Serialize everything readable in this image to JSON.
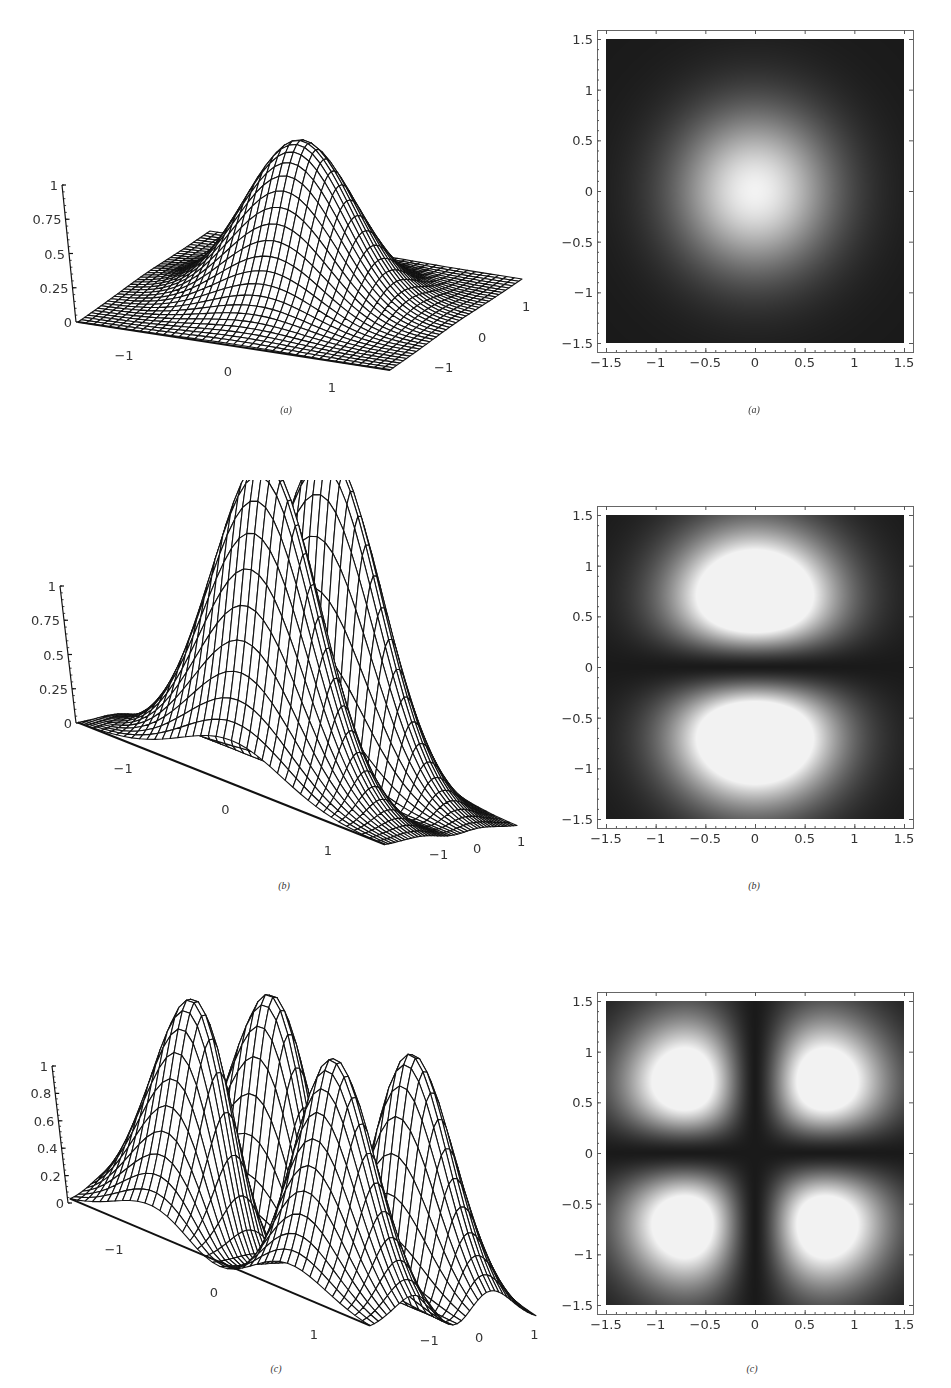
{
  "figure": {
    "rows": [
      {
        "caption_left": "(a)",
        "caption_right": "(a)",
        "z_ticks": [
          "0",
          "0.25",
          "0.5",
          "0.75",
          "1"
        ]
      },
      {
        "caption_left": "(b)",
        "caption_right": "(b)",
        "z_ticks": [
          "0",
          "0.25",
          "0.5",
          "0.75",
          "1"
        ]
      },
      {
        "caption_left": "(c)",
        "caption_right": "(c)",
        "z_ticks": [
          "0",
          "0.2",
          "0.4",
          "0.6",
          "0.8",
          "1"
        ]
      }
    ],
    "surface_axis_ticks": {
      "front_axis": [
        "-1",
        "0",
        "1"
      ],
      "side_axis": [
        "1",
        "0",
        "-1"
      ]
    },
    "density_axis_ticks": {
      "x": [
        "-1.5",
        "-1",
        "-0.5",
        "0",
        "0.5",
        "1",
        "1.5"
      ],
      "y": [
        "1.5",
        "1",
        "0.5",
        "0",
        "-0.5",
        "-1",
        "-1.5"
      ]
    },
    "colors": {
      "background": "#ffffff",
      "wire": "#111111",
      "surface_fill": "#ffffff",
      "density_low": "#1a1a1a",
      "density_high": "#f2f2f2"
    }
  },
  "chart_data": [
    {
      "type": "surface3d",
      "panel": "(a) left",
      "title": "",
      "description": "Wireframe surface of a single central Gaussian peak",
      "function": "exp(-2(x^2+y^2))",
      "peaks": [
        {
          "x": 0,
          "y": 0,
          "z": 1.0
        }
      ],
      "x_range": [
        -1.5,
        1.5
      ],
      "y_range": [
        -1.5,
        1.5
      ],
      "zlim": [
        0,
        1
      ],
      "x_ticks": [
        -1,
        0,
        1
      ],
      "y_ticks": [
        -1,
        0,
        1
      ],
      "z_ticks": [
        0,
        0.25,
        0.5,
        0.75,
        1
      ]
    },
    {
      "type": "heatmap",
      "panel": "(a) right",
      "title": "",
      "description": "Density plot: single bright spot centered at origin",
      "function": "exp(-2(x^2+y^2))",
      "bright_spots": [
        {
          "x": 0,
          "y": 0
        }
      ],
      "xlim": [
        -1.5,
        1.5
      ],
      "ylim": [
        -1.5,
        1.5
      ],
      "x_ticks": [
        -1.5,
        -1,
        -0.5,
        0,
        0.5,
        1,
        1.5
      ],
      "y_ticks": [
        -1.5,
        -1,
        -0.5,
        0,
        0.5,
        1,
        1.5
      ],
      "colormap": "grayscale (dark=0, white=1)"
    },
    {
      "type": "surface3d",
      "panel": "(b) left",
      "title": "",
      "description": "Wireframe surface with two lobes separated along one axis",
      "function": "normalized y^2 exp(-2(x^2+y^2))",
      "peaks": [
        {
          "x": 0,
          "y": 0.6,
          "z": 1.0
        },
        {
          "x": 0,
          "y": -0.6,
          "z": 1.0
        }
      ],
      "x_range": [
        -1.5,
        1.5
      ],
      "y_range": [
        -1.5,
        1.5
      ],
      "zlim": [
        0,
        1
      ],
      "x_ticks": [
        -1,
        0,
        1
      ],
      "y_ticks": [
        -1,
        0,
        1
      ],
      "z_ticks": [
        0,
        0.25,
        0.5,
        0.75,
        1
      ]
    },
    {
      "type": "heatmap",
      "panel": "(b) right",
      "title": "",
      "description": "Density plot: two elongated bright spots at y = +0.6 and y = -0.6",
      "bright_spots": [
        {
          "x": 0,
          "y": 0.6
        },
        {
          "x": 0,
          "y": -0.6
        }
      ],
      "xlim": [
        -1.5,
        1.5
      ],
      "ylim": [
        -1.5,
        1.5
      ],
      "x_ticks": [
        -1.5,
        -1,
        -0.5,
        0,
        0.5,
        1,
        1.5
      ],
      "y_ticks": [
        -1.5,
        -1,
        -0.5,
        0,
        0.5,
        1,
        1.5
      ],
      "colormap": "grayscale (dark=0, white=1)"
    },
    {
      "type": "surface3d",
      "panel": "(c) left",
      "title": "",
      "description": "Wireframe surface with four lobes in a 2x2 arrangement",
      "function": "normalized x^2 y^2 exp(-2(x^2+y^2))",
      "peaks": [
        {
          "x": 0.5,
          "y": 0.5,
          "z": 1.0
        },
        {
          "x": -0.5,
          "y": 0.5,
          "z": 1.0
        },
        {
          "x": 0.5,
          "y": -0.5,
          "z": 1.0
        },
        {
          "x": -0.5,
          "y": -0.5,
          "z": 1.0
        }
      ],
      "x_range": [
        -1.5,
        1.5
      ],
      "y_range": [
        -1.5,
        1.5
      ],
      "zlim": [
        0,
        1
      ],
      "x_ticks": [
        -1,
        0,
        1
      ],
      "y_ticks": [
        -1,
        0,
        1
      ],
      "z_ticks": [
        0,
        0.2,
        0.4,
        0.6,
        0.8,
        1
      ]
    },
    {
      "type": "heatmap",
      "panel": "(c) right",
      "title": "",
      "description": "Density plot: four bright spots at (+/-0.5, +/-0.5)",
      "bright_spots": [
        {
          "x": -0.5,
          "y": 0.5
        },
        {
          "x": 0.5,
          "y": 0.5
        },
        {
          "x": -0.5,
          "y": -0.5
        },
        {
          "x": 0.5,
          "y": -0.5
        }
      ],
      "xlim": [
        -1.5,
        1.5
      ],
      "ylim": [
        -1.5,
        1.5
      ],
      "x_ticks": [
        -1.5,
        -1,
        -0.5,
        0,
        0.5,
        1,
        1.5
      ],
      "y_ticks": [
        -1.5,
        -1,
        -0.5,
        0,
        0.5,
        1,
        1.5
      ],
      "colormap": "grayscale (dark=0, white=1)"
    }
  ]
}
